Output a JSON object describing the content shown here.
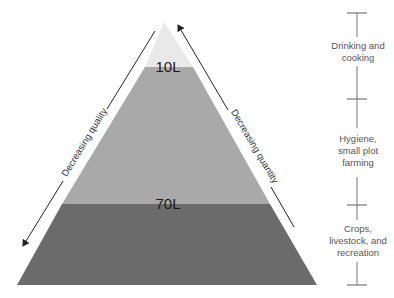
{
  "pyramid": {
    "tiers": [
      {
        "name": "top",
        "color": "#e9e9e9"
      },
      {
        "name": "middle",
        "color": "#a9a9a9"
      },
      {
        "name": "bottom",
        "color": "#6b6b6b"
      }
    ],
    "thresholds": [
      {
        "label": "10L"
      },
      {
        "label": "70L"
      }
    ]
  },
  "arrows": {
    "left": {
      "label": "Decreasing quality"
    },
    "right": {
      "label": "Decreasing quantity"
    }
  },
  "scale": {
    "uses": [
      {
        "label_line1": "Drinking and",
        "label_line2": "cooking",
        "label_line3": ""
      },
      {
        "label_line1": "Hygiene,",
        "label_line2": "small plot",
        "label_line3": "farming"
      },
      {
        "label_line1": "Crops,",
        "label_line2": "livestock, and",
        "label_line3": "recreation"
      }
    ]
  }
}
